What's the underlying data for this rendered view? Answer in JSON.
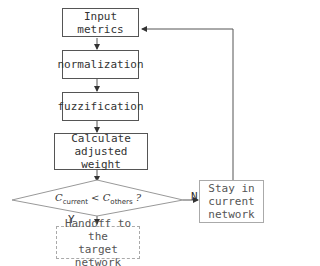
{
  "diagram": {
    "type": "flowchart",
    "nodes": [
      {
        "id": "input",
        "label": "Input metrics",
        "shape": "rect"
      },
      {
        "id": "norm",
        "label": "normalization",
        "shape": "rect"
      },
      {
        "id": "fuzz",
        "label": "fuzzification",
        "shape": "rect"
      },
      {
        "id": "calc",
        "label": "Calculate adjusted weight",
        "label_lines": [
          "Calculate",
          "adjusted weight"
        ],
        "shape": "rect"
      },
      {
        "id": "decision",
        "label": "C_current < C_others ?",
        "shape": "diamond",
        "parts": {
          "c1": "C",
          "c1_sub": "current",
          "op": "<",
          "c2": "C",
          "c2_sub": "others",
          "q": "?"
        }
      },
      {
        "id": "handoff",
        "label": "Handoff to the target network",
        "label_lines": [
          "Handoff to the",
          "target network"
        ],
        "shape": "rect"
      },
      {
        "id": "stay",
        "label": "Stay in current network",
        "label_lines": [
          "Stay in",
          "current",
          "network"
        ],
        "shape": "rect"
      }
    ],
    "edges": [
      {
        "from": "input",
        "to": "norm"
      },
      {
        "from": "norm",
        "to": "fuzz"
      },
      {
        "from": "fuzz",
        "to": "calc"
      },
      {
        "from": "calc",
        "to": "decision"
      },
      {
        "from": "decision",
        "to": "handoff",
        "label": "Y"
      },
      {
        "from": "decision",
        "to": "stay",
        "label": "N"
      },
      {
        "from": "stay",
        "to": "input"
      }
    ],
    "edge_labels": {
      "yes": "Y",
      "no": "N"
    }
  }
}
